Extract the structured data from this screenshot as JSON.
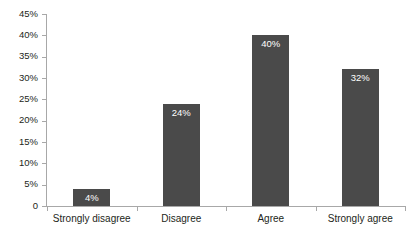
{
  "chart_data": {
    "type": "bar",
    "title": "",
    "subtitle": "",
    "xlabel": "",
    "ylabel": "",
    "categories": [
      "Strongly disagree",
      "Disagree",
      "Agree",
      "Strongly agree"
    ],
    "values": [
      4,
      24,
      40,
      32
    ],
    "value_labels": [
      "4%",
      "24%",
      "40%",
      "32%"
    ],
    "ylim": [
      0,
      45
    ],
    "ytick_values": [
      45,
      40,
      35,
      30,
      25,
      20,
      15,
      10,
      5,
      0
    ],
    "ytick_labels": [
      "45%",
      "40%",
      "35%",
      "30%",
      "25%",
      "20%",
      "15%",
      "10%",
      "5%",
      "0"
    ],
    "grid": false,
    "legend": false,
    "legend_position": "none",
    "series": [
      {
        "name": "Responses",
        "values": [
          4,
          24,
          40,
          32
        ]
      }
    ]
  },
  "style": {
    "bar_color": "#4a4a4a",
    "axis_color": "#a8a8a8",
    "text_color": "#231f20",
    "value_label_color": "#ffffff",
    "background": "#ffffff"
  }
}
